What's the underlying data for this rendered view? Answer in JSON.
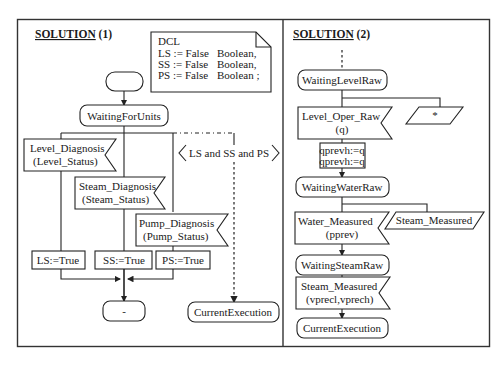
{
  "panel1": {
    "title": "SOLUTION",
    "title_suffix": "(1)",
    "dcl": {
      "header": "DCL",
      "rows": [
        {
          "var": "LS := False",
          "type": "Boolean,"
        },
        {
          "var": "SS := False",
          "type": "Boolean,"
        },
        {
          "var": "PS := False",
          "type": "Boolean ;"
        }
      ]
    },
    "start_state": "",
    "state_waiting": "WaitingForUnits",
    "inputs": [
      {
        "line1": "Level_Diagnosis",
        "line2": "(Level_Status)"
      },
      {
        "line1": "Steam_Diagnosis",
        "line2": "(Steam_Status)"
      },
      {
        "line1": "Pump_Diagnosis",
        "line2": "(Pump_Status)"
      }
    ],
    "condition": "LS and SS and PS",
    "tasks": [
      "LS:=True",
      "SS:=True",
      "PS:=True"
    ],
    "end_state": "-",
    "next_state": "CurrentExecution"
  },
  "panel2": {
    "title": "SOLUTION",
    "title_suffix": "(2)",
    "state_level": "WaitingLevelRaw",
    "input_level": {
      "line1": "Level_Oper_Raw",
      "line2": "(q)"
    },
    "save_symbol": "*",
    "task_lines": [
      "qprevh:=q",
      "qprevh:=q"
    ],
    "state_water": "WaitingWaterRaw",
    "input_water": {
      "line1": "Water_Measured",
      "line2": "(pprev)"
    },
    "save_steam": "Steam_Measured",
    "state_steam": "WaitingSteamRaw",
    "input_steam": {
      "line1": "Steam_Measured",
      "line2": "(vprecl,vprech)"
    },
    "state_current": "CurrentExecution"
  }
}
